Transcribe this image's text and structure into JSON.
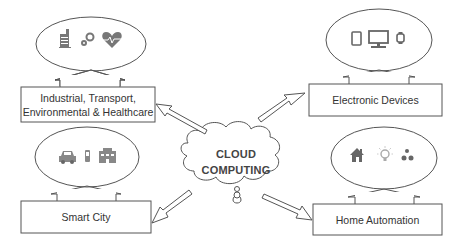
{
  "diagram": {
    "center": {
      "label_line1": "CLOUD",
      "label_line2": "COMPUTING",
      "icon": "user-icon"
    },
    "nodes": [
      {
        "id": "industrial",
        "label_line1": "Industrial, Transport,",
        "label_line2": "Environmental & Healthcare",
        "icons": [
          "factory-icon",
          "gears-icon",
          "heart-pulse-icon"
        ]
      },
      {
        "id": "electronic",
        "label": "Electronic Devices",
        "icons": [
          "tablet-icon",
          "desktop-icon",
          "smartwatch-icon"
        ]
      },
      {
        "id": "smart-city",
        "label": "Smart City",
        "icons": [
          "car-icon",
          "phone-icon",
          "building-icon"
        ]
      },
      {
        "id": "home",
        "label": "Home Automation",
        "icons": [
          "house-icon",
          "lightbulb-icon",
          "water-drops-icon"
        ]
      }
    ],
    "edges": [
      {
        "from": "cloud",
        "to": "industrial"
      },
      {
        "from": "cloud",
        "to": "electronic"
      },
      {
        "from": "cloud",
        "to": "smart-city"
      },
      {
        "from": "cloud",
        "to": "home"
      }
    ],
    "colors": {
      "stroke": "#555555",
      "icon": "#6b6b6b",
      "text": "#333333"
    }
  }
}
